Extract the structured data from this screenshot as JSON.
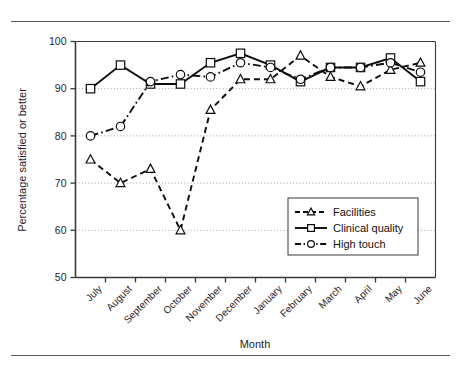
{
  "chart_data": {
    "type": "line",
    "title": "",
    "xlabel": "Month",
    "ylabel": "Percentage satisfied or better",
    "categories": [
      "July",
      "August",
      "September",
      "October",
      "November",
      "December",
      "January",
      "February",
      "March",
      "April",
      "May",
      "June"
    ],
    "ylim": [
      50,
      100
    ],
    "yticks": [
      50,
      60,
      70,
      80,
      90,
      100
    ],
    "ytick_labels": [
      "50",
      "60",
      "70",
      "80",
      "90",
      "100"
    ],
    "grid": "horizontal-dotted",
    "legend_position": "center-right",
    "series": [
      {
        "name": "Facilities",
        "marker": "triangle",
        "line_style": "dashed",
        "values": [
          75,
          70,
          73,
          60,
          85.5,
          92,
          92,
          97,
          92.5,
          90.5,
          94,
          95.5
        ]
      },
      {
        "name": "Clinical quality",
        "marker": "square",
        "line_style": "solid",
        "values": [
          90,
          95,
          91,
          91,
          95.5,
          97.5,
          95,
          91.5,
          94.5,
          94.5,
          96.5,
          91.5
        ]
      },
      {
        "name": "High touch",
        "marker": "circle",
        "line_style": "dash-dot",
        "values": [
          80,
          82,
          91.5,
          93,
          92.5,
          95.5,
          94.5,
          92,
          94.5,
          94.5,
          95.5,
          93.5
        ]
      }
    ]
  },
  "legend": {
    "entries": [
      {
        "label": "Facilities"
      },
      {
        "label": "Clinical quality"
      },
      {
        "label": "High touch"
      }
    ]
  },
  "axes": {
    "y_title": "Percentage satisfied or better",
    "x_title": "Month"
  },
  "colors": {
    "ink": "#0d0d0d",
    "frame": "#3a3a3a",
    "grid": "#9a9a9a",
    "rule": "#555a5c",
    "background": "#ffffff"
  }
}
